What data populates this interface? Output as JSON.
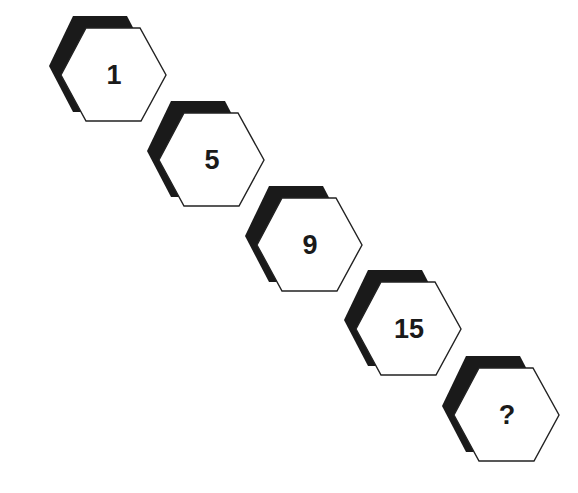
{
  "puzzle": {
    "type": "number-sequence",
    "items": [
      {
        "value": "1",
        "left": 49,
        "top": 16
      },
      {
        "value": "5",
        "left": 147,
        "top": 101
      },
      {
        "value": "9",
        "left": 245,
        "top": 186
      },
      {
        "value": "15",
        "left": 344,
        "top": 270
      },
      {
        "value": "?",
        "left": 442,
        "top": 356
      }
    ],
    "colors": {
      "shadow": "#1a1a1a",
      "face": "#ffffff",
      "stroke": "#222222"
    }
  }
}
